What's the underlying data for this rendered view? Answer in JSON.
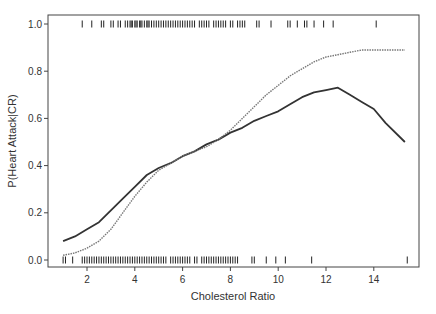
{
  "chart_data": {
    "type": "line",
    "title": "",
    "xlabel": "Cholesterol Ratio",
    "ylabel": "P(Heart Attack|CR)",
    "xlim": [
      0.6,
      16.0
    ],
    "ylim": [
      -0.03,
      1.03
    ],
    "x_ticks": [
      2,
      4,
      6,
      8,
      10,
      12,
      14
    ],
    "y_ticks": [
      0.0,
      0.2,
      0.4,
      0.6,
      0.8,
      1.0
    ],
    "y_tick_labels": [
      "0.0",
      "0.2",
      "0.4",
      "0.6",
      "0.8",
      "1.0"
    ],
    "grid": false,
    "legend": null,
    "series": [
      {
        "name": "Fitted probability (solid)",
        "style": "solid",
        "color": "#333333",
        "x": [
          1.0,
          1.5,
          2.0,
          2.5,
          3.0,
          3.5,
          4.0,
          4.5,
          5.0,
          5.5,
          6.0,
          6.5,
          7.0,
          7.5,
          8.0,
          8.5,
          9.0,
          9.5,
          10.0,
          10.5,
          11.0,
          11.5,
          12.0,
          12.5,
          13.0,
          13.5,
          14.0,
          14.5,
          15.3
        ],
        "y": [
          0.08,
          0.1,
          0.13,
          0.16,
          0.21,
          0.26,
          0.31,
          0.36,
          0.39,
          0.41,
          0.44,
          0.46,
          0.49,
          0.51,
          0.54,
          0.56,
          0.59,
          0.61,
          0.63,
          0.66,
          0.69,
          0.71,
          0.72,
          0.73,
          0.7,
          0.67,
          0.64,
          0.58,
          0.5
        ]
      },
      {
        "name": "Fitted probability (dashed)",
        "style": "dashed",
        "color": "#777777",
        "x": [
          1.0,
          1.5,
          2.0,
          2.5,
          3.0,
          3.5,
          4.0,
          4.5,
          5.0,
          5.5,
          6.0,
          6.5,
          7.0,
          7.5,
          8.0,
          8.5,
          9.0,
          9.5,
          10.0,
          10.5,
          11.0,
          11.5,
          12.0,
          12.5,
          13.0,
          13.5,
          14.0,
          14.5,
          15.3
        ],
        "y": [
          0.02,
          0.03,
          0.05,
          0.08,
          0.13,
          0.2,
          0.27,
          0.33,
          0.38,
          0.41,
          0.44,
          0.46,
          0.48,
          0.51,
          0.55,
          0.6,
          0.65,
          0.7,
          0.74,
          0.78,
          0.81,
          0.84,
          0.86,
          0.87,
          0.88,
          0.89,
          0.89,
          0.89,
          0.89
        ]
      }
    ],
    "rug_top_y": 1.0,
    "rug_top_x": [
      1.8,
      2.2,
      2.6,
      2.7,
      3.0,
      3.1,
      3.3,
      3.4,
      3.6,
      3.7,
      3.8,
      3.85,
      3.9,
      4.0,
      4.05,
      4.1,
      4.2,
      4.25,
      4.3,
      4.4,
      4.5,
      4.55,
      4.6,
      4.7,
      4.8,
      4.9,
      5.0,
      5.1,
      5.2,
      5.3,
      5.4,
      5.5,
      5.6,
      5.7,
      5.8,
      5.9,
      6.0,
      6.1,
      6.2,
      6.3,
      6.4,
      6.5,
      6.7,
      6.8,
      6.9,
      7.0,
      7.1,
      7.3,
      7.4,
      7.5,
      7.6,
      7.7,
      7.8,
      8.0,
      8.1,
      8.3,
      8.4,
      8.5,
      8.6,
      9.1,
      9.2,
      9.7,
      10.4,
      10.5,
      10.8,
      11.1,
      11.2,
      11.5,
      11.9,
      12.3,
      14.1
    ],
    "rug_bottom_y": 0.0,
    "rug_bottom_x": [
      1.0,
      1.1,
      1.4,
      1.8,
      1.9,
      2.0,
      2.1,
      2.2,
      2.3,
      2.4,
      2.5,
      2.6,
      2.7,
      2.8,
      2.9,
      3.0,
      3.1,
      3.2,
      3.3,
      3.4,
      3.5,
      3.6,
      3.7,
      3.8,
      3.9,
      4.0,
      4.1,
      4.2,
      4.3,
      4.4,
      4.5,
      4.6,
      4.7,
      4.8,
      4.9,
      5.0,
      5.1,
      5.2,
      5.3,
      5.5,
      5.6,
      5.7,
      5.8,
      5.9,
      6.0,
      6.1,
      6.2,
      6.3,
      6.5,
      6.6,
      6.8,
      6.9,
      7.0,
      7.1,
      7.2,
      7.3,
      7.4,
      7.5,
      7.6,
      7.7,
      7.8,
      7.9,
      8.0,
      8.1,
      8.2,
      8.3,
      8.9,
      9.0,
      9.5,
      9.9,
      10.3,
      11.4,
      15.4
    ]
  }
}
